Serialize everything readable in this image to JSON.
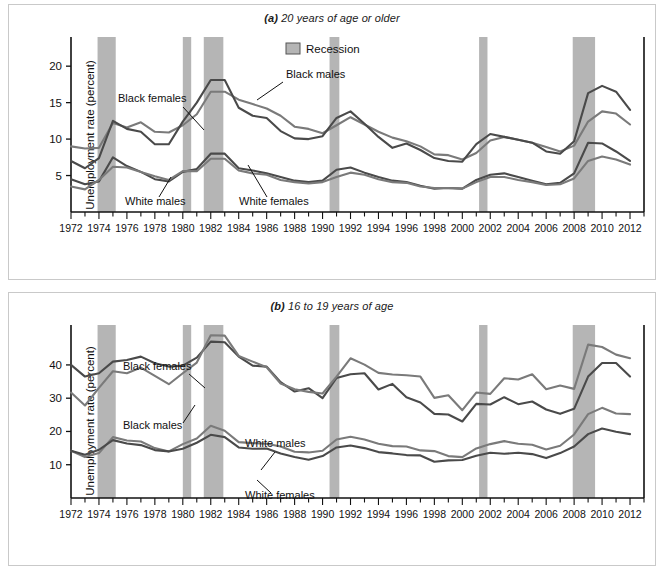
{
  "figure": {
    "background": "#ffffff",
    "recession_color": "#b5b5b5",
    "line_color_light": "#7a7a7a",
    "line_color_dark": "#4a4a4a"
  },
  "panel_a": {
    "title_marker": "(a)",
    "title_text": " 20 years of age or older",
    "ylabel": "Unemployment rate (percent)",
    "legend_label": "Recession",
    "annotations": [
      "Black females",
      "Black males",
      "White males",
      "White females"
    ]
  },
  "panel_b": {
    "title_marker": "(b)",
    "title_text": " 16 to 19 years of age",
    "ylabel": "Unemployment rate (percent)",
    "annotations": [
      "Black females",
      "Black males",
      "White males",
      "White females"
    ]
  },
  "chart_data": [
    {
      "type": "line",
      "title": "(a) 20 years of age or older",
      "xlabel": "",
      "ylabel": "Unemployment rate (percent)",
      "xlim": [
        1972,
        2013
      ],
      "ylim": [
        0,
        24
      ],
      "yticks": [
        5,
        10,
        15,
        20
      ],
      "xticks": [
        1972,
        1974,
        1976,
        1978,
        1980,
        1982,
        1984,
        1986,
        1988,
        1990,
        1992,
        1994,
        1996,
        1998,
        2000,
        2002,
        2004,
        2006,
        2008,
        2010,
        2012
      ],
      "xticklabels": [
        "1972",
        "1974",
        "1976",
        "1978",
        "1980",
        "1982",
        "1984",
        "1986",
        "1988",
        "1990",
        "1992",
        "1994",
        "1996",
        "1998",
        "2000",
        "2002",
        "2004",
        "2006",
        "2008",
        "2010",
        "2012"
      ],
      "grid": false,
      "legend": [
        "Recession"
      ],
      "legend_position": "top-center",
      "recessions": [
        {
          "start": 1973.9,
          "end": 1975.2
        },
        {
          "start": 1980.0,
          "end": 1980.6
        },
        {
          "start": 1981.5,
          "end": 1982.9
        },
        {
          "start": 1990.5,
          "end": 1991.2
        },
        {
          "start": 2001.2,
          "end": 2001.8
        },
        {
          "start": 2007.9,
          "end": 2009.5
        }
      ],
      "x": [
        1972,
        1973,
        1974,
        1975,
        1976,
        1977,
        1978,
        1979,
        1980,
        1981,
        1982,
        1983,
        1984,
        1985,
        1986,
        1987,
        1988,
        1989,
        1990,
        1991,
        1992,
        1993,
        1994,
        1995,
        1996,
        1997,
        1998,
        1999,
        2000,
        2001,
        2002,
        2003,
        2004,
        2005,
        2006,
        2007,
        2008,
        2009,
        2010,
        2011,
        2012
      ],
      "series": [
        {
          "name": "Black females",
          "color": "#7a7a7a",
          "values": [
            9.0,
            8.7,
            8.8,
            12.2,
            11.6,
            12.3,
            11.0,
            10.9,
            11.9,
            13.4,
            16.5,
            16.5,
            15.4,
            14.8,
            14.2,
            13.2,
            11.7,
            11.4,
            10.8,
            11.9,
            13.0,
            12.0,
            11.0,
            10.2,
            9.7,
            9.0,
            7.9,
            7.8,
            7.2,
            8.1,
            9.8,
            10.3,
            9.9,
            9.5,
            8.9,
            8.3,
            9.1,
            12.4,
            13.8,
            13.5,
            12.0
          ]
        },
        {
          "name": "Black males",
          "color": "#4a4a4a",
          "values": [
            7.0,
            6.0,
            7.4,
            12.5,
            11.4,
            11.0,
            9.3,
            9.3,
            12.4,
            15.0,
            18.1,
            18.1,
            14.3,
            13.2,
            12.9,
            11.1,
            10.1,
            10.0,
            10.4,
            12.9,
            13.8,
            12.1,
            10.3,
            8.8,
            9.4,
            8.5,
            7.4,
            7.0,
            6.9,
            9.3,
            10.7,
            10.3,
            9.9,
            9.5,
            8.3,
            8.0,
            9.7,
            16.3,
            17.3,
            16.5,
            14.0
          ]
        },
        {
          "name": "White males",
          "color": "#4a4a4a",
          "values": [
            4.5,
            3.8,
            4.2,
            7.5,
            6.3,
            5.5,
            4.5,
            4.2,
            5.5,
            5.9,
            8.0,
            8.0,
            6.0,
            5.7,
            5.3,
            4.8,
            4.3,
            4.1,
            4.3,
            5.8,
            6.1,
            5.4,
            4.8,
            4.3,
            4.1,
            3.6,
            3.2,
            3.3,
            3.2,
            4.4,
            5.1,
            5.3,
            4.8,
            4.3,
            3.8,
            4.0,
            5.3,
            9.5,
            9.4,
            8.3,
            7.0
          ]
        },
        {
          "name": "White females",
          "color": "#7a7a7a",
          "values": [
            3.5,
            3.1,
            4.4,
            6.2,
            6.1,
            5.5,
            4.9,
            4.4,
            5.6,
            5.6,
            7.3,
            7.3,
            5.7,
            5.3,
            5.1,
            4.4,
            4.1,
            3.9,
            4.1,
            4.8,
            5.4,
            5.1,
            4.5,
            4.1,
            4.0,
            3.5,
            3.3,
            3.3,
            3.2,
            4.1,
            4.8,
            4.8,
            4.4,
            4.1,
            3.7,
            3.8,
            4.6,
            7.0,
            7.6,
            7.2,
            6.5
          ]
        }
      ]
    },
    {
      "type": "line",
      "title": "(b) 16 to 19 years of age",
      "xlabel": "",
      "ylabel": "Unemployment rate (percent)",
      "xlim": [
        1972,
        2013
      ],
      "ylim": [
        0,
        52
      ],
      "yticks": [
        10,
        20,
        30,
        40
      ],
      "xticks": [
        1972,
        1974,
        1976,
        1978,
        1980,
        1982,
        1984,
        1986,
        1988,
        1990,
        1992,
        1994,
        1996,
        1998,
        2000,
        2002,
        2004,
        2006,
        2008,
        2010,
        2012
      ],
      "xticklabels": [
        "1972",
        "1974",
        "1976",
        "1978",
        "1980",
        "1982",
        "1984",
        "1986",
        "1988",
        "1990",
        "1992",
        "1994",
        "1996",
        "1998",
        "2000",
        "2002",
        "2004",
        "2006",
        "2008",
        "2010",
        "2012"
      ],
      "grid": false,
      "legend": [],
      "recessions": [
        {
          "start": 1973.9,
          "end": 1975.2
        },
        {
          "start": 1980.0,
          "end": 1980.6
        },
        {
          "start": 1981.5,
          "end": 1982.9
        },
        {
          "start": 1990.5,
          "end": 1991.2
        },
        {
          "start": 2001.2,
          "end": 2001.8
        },
        {
          "start": 2007.9,
          "end": 2009.5
        }
      ],
      "x": [
        1972,
        1973,
        1974,
        1975,
        1976,
        1977,
        1978,
        1979,
        1980,
        1981,
        1982,
        1983,
        1984,
        1985,
        1986,
        1987,
        1988,
        1989,
        1990,
        1991,
        1992,
        1993,
        1994,
        1995,
        1996,
        1997,
        1998,
        1999,
        2000,
        2001,
        2002,
        2003,
        2004,
        2005,
        2006,
        2007,
        2008,
        2009,
        2010,
        2011,
        2012
      ],
      "series": [
        {
          "name": "Black females",
          "color": "#4a4a4a",
          "values": [
            40.0,
            36.5,
            37.5,
            41.0,
            41.5,
            42.5,
            40.5,
            39.5,
            39.8,
            42.2,
            47.0,
            46.8,
            42.5,
            39.8,
            39.5,
            34.8,
            32.0,
            33.0,
            30.0,
            36.1,
            37.2,
            37.5,
            32.6,
            34.3,
            30.3,
            28.7,
            25.3,
            25.1,
            23.0,
            28.3,
            28.1,
            30.3,
            28.2,
            29.0,
            26.6,
            25.3,
            26.8,
            36.5,
            40.6,
            40.6,
            36.5
          ]
        },
        {
          "name": "Black males",
          "color": "#7a7a7a",
          "values": [
            31.7,
            27.8,
            33.1,
            38.1,
            37.5,
            39.2,
            36.7,
            34.2,
            37.5,
            40.7,
            48.9,
            48.8,
            42.7,
            41.0,
            39.3,
            34.4,
            32.7,
            31.9,
            31.4,
            36.5,
            42.0,
            40.1,
            37.6,
            37.1,
            36.9,
            36.5,
            30.1,
            30.9,
            26.4,
            31.7,
            31.3,
            36.0,
            35.6,
            37.2,
            32.7,
            33.8,
            32.8,
            46.1,
            45.4,
            43.1,
            42.0
          ]
        },
        {
          "name": "White males",
          "color": "#7a7a7a",
          "values": [
            14.2,
            12.3,
            13.5,
            18.3,
            17.3,
            17.0,
            15.0,
            14.0,
            16.2,
            17.9,
            21.7,
            20.2,
            16.8,
            16.5,
            16.3,
            15.5,
            13.9,
            13.7,
            14.2,
            17.6,
            18.4,
            17.6,
            16.3,
            15.6,
            15.5,
            14.3,
            14.1,
            12.6,
            12.3,
            14.9,
            16.2,
            17.1,
            16.3,
            16.0,
            14.6,
            15.7,
            19.1,
            25.2,
            27.1,
            25.4,
            25.2
          ]
        },
        {
          "name": "White females",
          "color": "#4a4a4a",
          "values": [
            14.2,
            13.0,
            14.5,
            17.4,
            16.4,
            15.9,
            14.4,
            14.0,
            14.8,
            16.6,
            19.0,
            18.3,
            15.2,
            14.8,
            14.9,
            13.4,
            12.3,
            11.5,
            12.6,
            15.2,
            15.8,
            15.0,
            13.8,
            13.4,
            12.9,
            12.8,
            10.9,
            11.3,
            11.4,
            12.7,
            13.6,
            13.3,
            13.6,
            13.2,
            12.0,
            13.5,
            15.5,
            19.2,
            20.9,
            19.9,
            19.2
          ]
        }
      ]
    }
  ]
}
